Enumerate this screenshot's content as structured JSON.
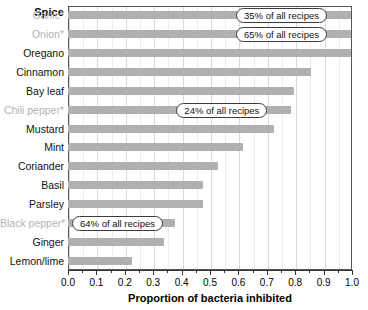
{
  "header": {
    "category_title": "Spice"
  },
  "axis": {
    "x_title": "Proportion of bacteria inhibited",
    "tick_labels": [
      "0.0",
      "0.1",
      "0.2",
      "0.3",
      "0.4",
      "0.5",
      "0.6",
      "0.7",
      "0.8",
      "0.9",
      "1.0"
    ]
  },
  "colors": {
    "bar": "#b0b0b0",
    "muted_label": "#b3b3b3",
    "label": "#111111",
    "gridline": "#d9d9d9",
    "frame": "#555555"
  },
  "callouts": [
    {
      "spice": "Garlic",
      "text": "35% of all recipes"
    },
    {
      "spice": "Onion",
      "text": "65% of all recipes"
    },
    {
      "spice": "Chili pepper",
      "text": "24% of all recipes"
    },
    {
      "spice": "Black pepper",
      "text": "64% of all recipes"
    }
  ],
  "rows": [
    {
      "label": "Garlic*",
      "value": 1.0,
      "muted": true,
      "callout": "35% of all recipes"
    },
    {
      "label": "Onion*",
      "value": 1.0,
      "muted": true,
      "callout": "65% of all recipes"
    },
    {
      "label": "Oregano",
      "value": 1.0,
      "muted": false,
      "callout": ""
    },
    {
      "label": "Cinnamon",
      "value": 0.86,
      "muted": false,
      "callout": ""
    },
    {
      "label": "Bay leaf",
      "value": 0.8,
      "muted": false,
      "callout": ""
    },
    {
      "label": "Chili pepper*",
      "value": 0.79,
      "muted": true,
      "callout": "24% of all recipes"
    },
    {
      "label": "Mustard",
      "value": 0.73,
      "muted": false,
      "callout": ""
    },
    {
      "label": "Mint",
      "value": 0.62,
      "muted": false,
      "callout": ""
    },
    {
      "label": "Coriander",
      "value": 0.53,
      "muted": false,
      "callout": ""
    },
    {
      "label": "Basil",
      "value": 0.48,
      "muted": false,
      "callout": ""
    },
    {
      "label": "Parsley",
      "value": 0.48,
      "muted": false,
      "callout": ""
    },
    {
      "label": "Black pepper*",
      "value": 0.38,
      "muted": true,
      "callout": "64% of all recipes"
    },
    {
      "label": "Ginger",
      "value": 0.34,
      "muted": false,
      "callout": ""
    },
    {
      "label": "Lemon/lime",
      "value": 0.23,
      "muted": false,
      "callout": ""
    }
  ],
  "chart_data": {
    "type": "bar",
    "orientation": "horizontal",
    "title": "",
    "xlabel": "Proportion of bacteria inhibited",
    "ylabel": "Spice",
    "xlim": [
      0.0,
      1.0
    ],
    "grid": true,
    "legend": "none",
    "categories": [
      "Garlic*",
      "Onion*",
      "Oregano",
      "Cinnamon",
      "Bay leaf",
      "Chili pepper*",
      "Mustard",
      "Mint",
      "Coriander",
      "Basil",
      "Parsley",
      "Black pepper*",
      "Ginger",
      "Lemon/lime"
    ],
    "values": [
      1.0,
      1.0,
      1.0,
      0.86,
      0.8,
      0.79,
      0.73,
      0.62,
      0.53,
      0.48,
      0.48,
      0.38,
      0.34,
      0.23
    ],
    "xticks": [
      0.0,
      0.1,
      0.2,
      0.3,
      0.4,
      0.5,
      0.6,
      0.7,
      0.8,
      0.9,
      1.0
    ],
    "xtick_labels": [
      "0.0",
      "0.1",
      "0.2",
      "0.3",
      "0.4",
      "0.5",
      "0.6",
      "0.7",
      "0.8",
      "0.9",
      "1.0"
    ],
    "annotations": [
      {
        "category": "Garlic*",
        "text": "35% of all recipes"
      },
      {
        "category": "Onion*",
        "text": "65% of all recipes"
      },
      {
        "category": "Chili pepper*",
        "text": "24% of all recipes"
      },
      {
        "category": "Black pepper*",
        "text": "64% of all recipes"
      }
    ]
  }
}
